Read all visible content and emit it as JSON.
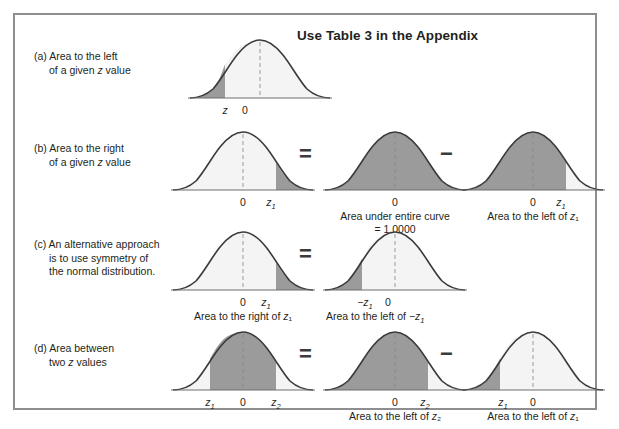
{
  "figure": {
    "title": "Use Table 3 in the Appendix",
    "border_color": "#8e8e90",
    "shade_dark": "#9b9b9b",
    "shade_light": "#f4f4f4",
    "curve_color": "#3a3a3a"
  },
  "operators": {
    "equals": "=",
    "minus": "−"
  },
  "rows": [
    {
      "id": "a",
      "label_line1": "(a) Area to the left",
      "label_line2": "of a given z value",
      "panels": [
        {
          "name": "curve-a-1",
          "ticks": [
            {
              "text": "z",
              "italic": true
            },
            {
              "text": "0",
              "italic": false
            }
          ],
          "caption": ""
        }
      ]
    },
    {
      "id": "b",
      "label_line1": "(b) Area to the right",
      "label_line2": "of a given z value",
      "panels": [
        {
          "name": "curve-b-1",
          "ticks": [
            {
              "text": "0",
              "italic": false
            },
            {
              "text": "z₁",
              "italic": true
            }
          ],
          "caption": ""
        },
        {
          "name": "curve-b-2",
          "ticks": [
            {
              "text": "0",
              "italic": false
            }
          ],
          "caption": "Area under entire curve = 1.0000"
        },
        {
          "name": "curve-b-3",
          "ticks": [
            {
              "text": "0",
              "italic": false
            },
            {
              "text": "z₁",
              "italic": true
            }
          ],
          "caption": "Area to the left of z₁"
        }
      ]
    },
    {
      "id": "c",
      "label_line1": "(c) An alternative approach",
      "label_line2": "is to use symmetry of",
      "label_line3": "the normal distribution.",
      "panels": [
        {
          "name": "curve-c-1",
          "ticks": [
            {
              "text": "0",
              "italic": false
            },
            {
              "text": "z₁",
              "italic": true
            }
          ],
          "caption": "Area to the right of z₁"
        },
        {
          "name": "curve-c-2",
          "ticks": [
            {
              "text": "−z₁",
              "italic": true
            },
            {
              "text": "0",
              "italic": false
            }
          ],
          "caption": "Area to the left of −z₁"
        }
      ]
    },
    {
      "id": "d",
      "label_line1": "(d) Area between",
      "label_line2": "two z values",
      "panels": [
        {
          "name": "curve-d-1",
          "ticks": [
            {
              "text": "z₁",
              "italic": true
            },
            {
              "text": "0",
              "italic": false
            },
            {
              "text": "z₂",
              "italic": true
            }
          ],
          "caption": ""
        },
        {
          "name": "curve-d-2",
          "ticks": [
            {
              "text": "0",
              "italic": false
            },
            {
              "text": "z₂",
              "italic": true
            }
          ],
          "caption": "Area to the left of z₂"
        },
        {
          "name": "curve-d-3",
          "ticks": [
            {
              "text": "z₁",
              "italic": true
            },
            {
              "text": "0",
              "italic": false
            }
          ],
          "caption": "Area to the left of z₁"
        }
      ]
    }
  ],
  "chart_data": {
    "type": "area",
    "title": "Use Table 3 in the Appendix",
    "distribution": "standard normal, mean 0, sd 1",
    "curves": [
      {
        "id": "a1",
        "row": "a",
        "tick_labels": [
          "z",
          "0"
        ],
        "tick_z": [
          -0.85,
          0
        ],
        "shaded_region": "left of z",
        "shade_from": "-inf",
        "shade_to": -0.85
      },
      {
        "id": "b1",
        "row": "b",
        "tick_labels": [
          "0",
          "z1"
        ],
        "tick_z": [
          0,
          0.95
        ],
        "shaded_region": "right of z1",
        "shade_from": 0.95,
        "shade_to": "+inf"
      },
      {
        "id": "b2",
        "row": "b",
        "tick_labels": [
          "0"
        ],
        "tick_z": [
          0
        ],
        "shaded_region": "entire curve",
        "shade_from": "-inf",
        "shade_to": "+inf",
        "area_value": 1.0
      },
      {
        "id": "b3",
        "row": "b",
        "tick_labels": [
          "0",
          "z1"
        ],
        "tick_z": [
          0,
          0.95
        ],
        "shaded_region": "left of z1",
        "shade_from": "-inf",
        "shade_to": 0.95
      },
      {
        "id": "c1",
        "row": "c",
        "tick_labels": [
          "0",
          "z1"
        ],
        "tick_z": [
          0,
          0.95
        ],
        "shaded_region": "right of z1",
        "shade_from": 0.95,
        "shade_to": "+inf"
      },
      {
        "id": "c2",
        "row": "c",
        "tick_labels": [
          "-z1",
          "0"
        ],
        "tick_z": [
          -0.95,
          0
        ],
        "shaded_region": "left of -z1",
        "shade_from": "-inf",
        "shade_to": -0.95
      },
      {
        "id": "d1",
        "row": "d",
        "tick_labels": [
          "z1",
          "0",
          "z2"
        ],
        "tick_z": [
          -1.0,
          0,
          1.0
        ],
        "shaded_region": "between z1 and z2",
        "shade_from": -1.0,
        "shade_to": 1.0
      },
      {
        "id": "d2",
        "row": "d",
        "tick_labels": [
          "0",
          "z2"
        ],
        "tick_z": [
          0,
          1.0
        ],
        "shaded_region": "left of z2",
        "shade_from": "-inf",
        "shade_to": 1.0
      },
      {
        "id": "d3",
        "row": "d",
        "tick_labels": [
          "z1",
          "0"
        ],
        "tick_z": [
          -1.0,
          0
        ],
        "shaded_region": "left of z1",
        "shade_from": "-inf",
        "shade_to": -1.0
      }
    ],
    "equations": [
      "Area right of z1 = Area under entire curve (1.0000) - Area left of z1",
      "Area right of z1 = Area left of -z1",
      "Area between z1 and z2 = Area left of z2 - Area left of z1"
    ]
  }
}
